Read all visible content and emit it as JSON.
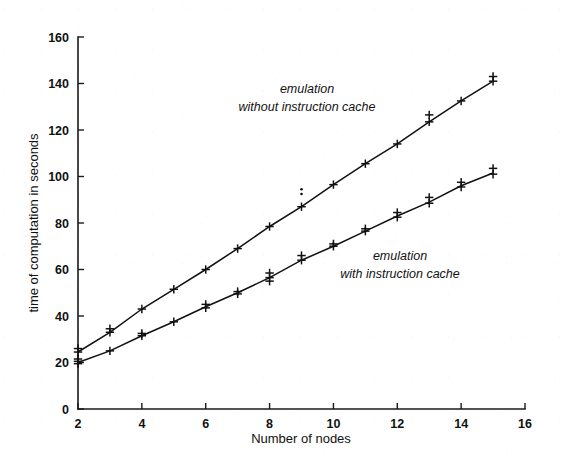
{
  "chart_data": {
    "type": "line",
    "title": "",
    "xlabel": "Number of nodes",
    "ylabel": "time of computation in seconds",
    "xlim": [
      2,
      16
    ],
    "ylim": [
      0,
      160
    ],
    "xticks": [
      2,
      4,
      6,
      8,
      10,
      12,
      14,
      16
    ],
    "yticks": [
      0,
      20,
      40,
      60,
      80,
      100,
      120,
      140,
      160
    ],
    "grid": false,
    "legend_position": "inline-annotations",
    "marker": "plus",
    "x": [
      2,
      3,
      4,
      5,
      6,
      7,
      8,
      9,
      10,
      11,
      12,
      13,
      14,
      15
    ],
    "series": [
      {
        "name": "emulation without instruction cache",
        "annotation_line1": "emulation",
        "annotation_line2": "without instruction cache",
        "values": [
          24.5,
          33.0,
          43.0,
          51.5,
          60.0,
          69.0,
          78.5,
          87.0,
          96.5,
          105.5,
          114.0,
          123.5,
          132.5,
          141.0
        ],
        "scatter": [
          {
            "x": 2,
            "y": 24.5
          },
          {
            "x": 2,
            "y": 26.0
          },
          {
            "x": 3,
            "y": 33.0
          },
          {
            "x": 3,
            "y": 34.5
          },
          {
            "x": 4,
            "y": 43.0
          },
          {
            "x": 5,
            "y": 51.5
          },
          {
            "x": 6,
            "y": 60.0
          },
          {
            "x": 7,
            "y": 69.0
          },
          {
            "x": 8,
            "y": 78.5
          },
          {
            "x": 9,
            "y": 87.0
          },
          {
            "x": 9,
            "y": 92.5
          },
          {
            "x": 9,
            "y": 94.5
          },
          {
            "x": 10,
            "y": 96.5
          },
          {
            "x": 11,
            "y": 105.5
          },
          {
            "x": 12,
            "y": 114.0
          },
          {
            "x": 13,
            "y": 123.5
          },
          {
            "x": 13,
            "y": 126.5
          },
          {
            "x": 14,
            "y": 132.5
          },
          {
            "x": 15,
            "y": 141.0
          },
          {
            "x": 15,
            "y": 143.0
          }
        ]
      },
      {
        "name": "emulation with instruction cache",
        "annotation_line1": "emulation",
        "annotation_line2": "with instruction cache",
        "values": [
          20.0,
          25.0,
          31.5,
          37.5,
          44.0,
          50.0,
          56.5,
          64.0,
          70.0,
          76.5,
          83.0,
          89.0,
          96.0,
          101.5
        ],
        "scatter": [
          {
            "x": 2,
            "y": 19.5
          },
          {
            "x": 2,
            "y": 20.5
          },
          {
            "x": 2,
            "y": 21.5
          },
          {
            "x": 3,
            "y": 25.0
          },
          {
            "x": 4,
            "y": 31.5
          },
          {
            "x": 4,
            "y": 32.5
          },
          {
            "x": 5,
            "y": 37.5
          },
          {
            "x": 6,
            "y": 43.5
          },
          {
            "x": 6,
            "y": 45.0
          },
          {
            "x": 7,
            "y": 49.5
          },
          {
            "x": 7,
            "y": 50.5
          },
          {
            "x": 8,
            "y": 55.0
          },
          {
            "x": 8,
            "y": 56.5
          },
          {
            "x": 8,
            "y": 58.5
          },
          {
            "x": 9,
            "y": 64.0
          },
          {
            "x": 9,
            "y": 66.0
          },
          {
            "x": 10,
            "y": 70.0
          },
          {
            "x": 10,
            "y": 71.0
          },
          {
            "x": 11,
            "y": 76.5
          },
          {
            "x": 11,
            "y": 77.5
          },
          {
            "x": 12,
            "y": 82.5
          },
          {
            "x": 12,
            "y": 84.5
          },
          {
            "x": 13,
            "y": 88.5
          },
          {
            "x": 13,
            "y": 91.0
          },
          {
            "x": 14,
            "y": 95.5
          },
          {
            "x": 14,
            "y": 97.5
          },
          {
            "x": 15,
            "y": 101.0
          },
          {
            "x": 15,
            "y": 103.5
          }
        ]
      }
    ]
  },
  "axes": {
    "y_title": "time of computation in seconds",
    "x_title": "Number of nodes",
    "y_tick_labels": [
      "0",
      "20",
      "40",
      "60",
      "80",
      "100",
      "120",
      "140",
      "160"
    ],
    "x_tick_labels": [
      "2",
      "4",
      "6",
      "8",
      "10",
      "12",
      "14",
      "16"
    ]
  },
  "annotations": {
    "upper": {
      "line1": "emulation",
      "line2": "without instruction cache"
    },
    "lower": {
      "line1": "emulation",
      "line2": "with instruction cache"
    }
  },
  "colors": {
    "ink": "#111111",
    "background": "#ffffff"
  }
}
